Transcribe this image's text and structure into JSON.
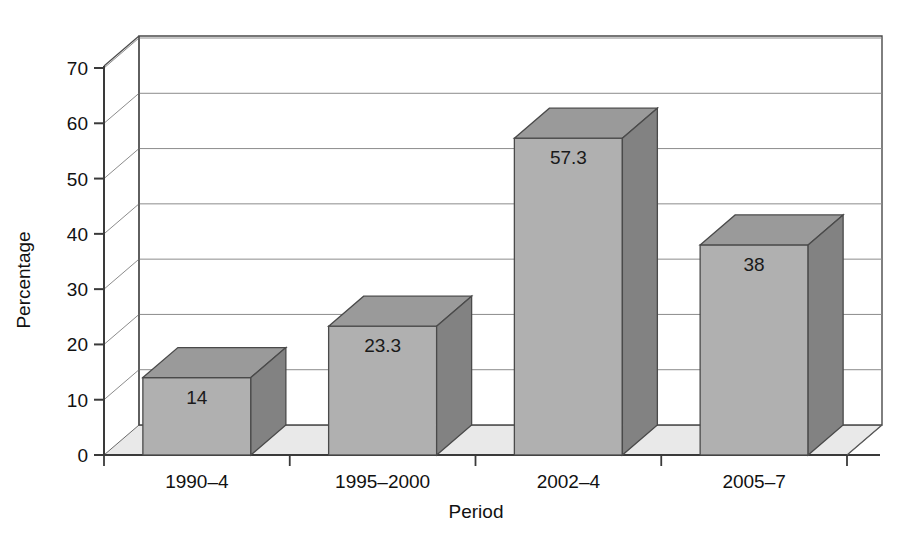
{
  "chart_data": {
    "type": "bar",
    "title": "",
    "xlabel": "Period",
    "ylabel": "Percentage",
    "categories": [
      "1990–4",
      "1995–2000",
      "2002–4",
      "2005–7"
    ],
    "values": [
      14,
      23.3,
      57.3,
      38
    ],
    "value_labels": [
      "14",
      "23.3",
      "57.3",
      "38"
    ],
    "ylim": [
      0,
      70
    ],
    "ytick_step": 10,
    "yticks": [
      0,
      10,
      20,
      30,
      40,
      50,
      60,
      70
    ],
    "ytick_labels": [
      "0",
      "10",
      "20",
      "30",
      "40",
      "50",
      "60",
      "70"
    ],
    "grid": true,
    "grid_axis": "y",
    "legend": "none",
    "style": "3d-bar",
    "colors": {
      "bar_front": "#b0b0b0",
      "bar_top": "#9a9a9a",
      "bar_side": "#828282",
      "floor": "#e9e9e9",
      "wall": "#ffffff",
      "axis": "#3a3a3a",
      "grid_line": "#8c8c8c",
      "text": "#111111"
    }
  }
}
